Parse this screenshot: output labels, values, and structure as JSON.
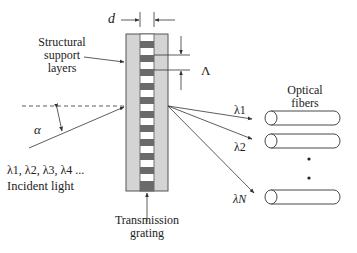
{
  "labels": {
    "d": "d",
    "structural": [
      "Structural",
      "support",
      "layers"
    ],
    "lambda_period": "Λ",
    "alpha": "α",
    "incident_wavelengths": "λ1, λ2, λ3, λ4 ...",
    "incident_light": "Incident light",
    "transmission": [
      "Transmission",
      "grating"
    ],
    "optical": [
      "Optical",
      "fibers"
    ],
    "out_wavelengths": [
      "λ1",
      "λ2",
      "λN"
    ]
  },
  "colors": {
    "support": "#d4d4d4",
    "stripe": "#6a6a6a",
    "line": "#333333"
  },
  "grating": {
    "stripe_count": 12
  }
}
